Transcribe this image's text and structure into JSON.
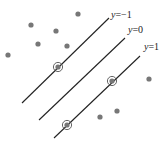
{
  "diagram": {
    "title": "",
    "colors": {
      "line": "#222222",
      "point": "#777777",
      "circle": "#555555",
      "background": "#ffffff"
    },
    "lines": [
      {
        "label_var": "y",
        "label_eq": "=−1",
        "x1": 22,
        "y1": 103,
        "x2": 109,
        "y2": 18,
        "lx": 111,
        "ly": 18
      },
      {
        "label_var": "y",
        "label_eq": "=0",
        "x1": 39,
        "y1": 120,
        "x2": 125,
        "y2": 38,
        "lx": 128,
        "ly": 33
      },
      {
        "label_var": "y",
        "label_eq": "=1",
        "x1": 54,
        "y1": 138,
        "x2": 140,
        "y2": 56,
        "lx": 144,
        "ly": 50
      }
    ],
    "support_vectors": [
      {
        "x": 58,
        "y": 67
      },
      {
        "x": 112,
        "y": 81
      },
      {
        "x": 67,
        "y": 125
      }
    ],
    "points": [
      {
        "x": 78,
        "y": 14
      },
      {
        "x": 31,
        "y": 25
      },
      {
        "x": 56,
        "y": 31
      },
      {
        "x": 38,
        "y": 44
      },
      {
        "x": 67,
        "y": 46
      },
      {
        "x": 8,
        "y": 55
      },
      {
        "x": 149,
        "y": 79
      },
      {
        "x": 100,
        "y": 117
      },
      {
        "x": 117,
        "y": 111
      }
    ]
  }
}
